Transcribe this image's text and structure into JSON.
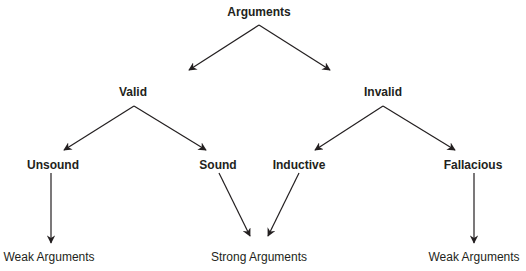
{
  "diagram": {
    "type": "tree",
    "colors": {
      "text": "#231f20",
      "lines": "#231f20",
      "background": "#ffffff"
    },
    "nodes": {
      "root": {
        "label": "Arguments"
      },
      "valid": {
        "label": "Valid"
      },
      "invalid": {
        "label": "Invalid"
      },
      "unsound": {
        "label": "Unsound"
      },
      "sound": {
        "label": "Sound"
      },
      "inductive": {
        "label": "Inductive"
      },
      "fallacious": {
        "label": "Fallacious"
      },
      "weak_left": {
        "label": "Weak Arguments"
      },
      "strong": {
        "label": "Strong Arguments"
      },
      "weak_right": {
        "label": "Weak Arguments"
      }
    },
    "edges": [
      {
        "from": "Arguments",
        "to": "Valid"
      },
      {
        "from": "Arguments",
        "to": "Invalid"
      },
      {
        "from": "Valid",
        "to": "Unsound"
      },
      {
        "from": "Valid",
        "to": "Sound"
      },
      {
        "from": "Invalid",
        "to": "Inductive"
      },
      {
        "from": "Invalid",
        "to": "Fallacious"
      },
      {
        "from": "Unsound",
        "to": "Weak Arguments"
      },
      {
        "from": "Sound",
        "to": "Strong Arguments"
      },
      {
        "from": "Inductive",
        "to": "Strong Arguments"
      },
      {
        "from": "Fallacious",
        "to": "Weak Arguments"
      }
    ]
  }
}
